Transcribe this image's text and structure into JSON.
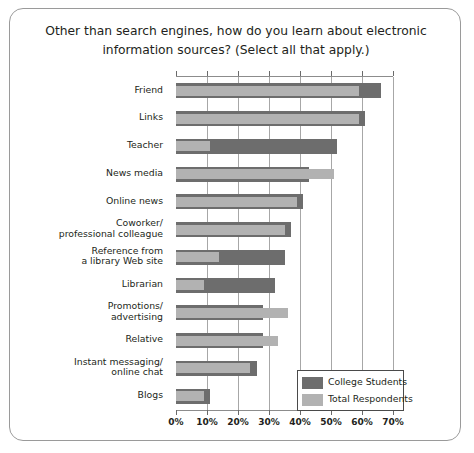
{
  "chart_data": {
    "type": "bar",
    "orientation": "horizontal",
    "title": "Other than search engines, how do you learn about electronic information sources? (Select all that apply.)",
    "title_line1": "Other than search engines, how do you learn about electronic",
    "title_line2": "information sources? (Select all that apply.)",
    "xlabel": "",
    "ylabel": "",
    "xlim": [
      0,
      70
    ],
    "xticks": [
      0,
      10,
      20,
      30,
      40,
      50,
      60,
      70
    ],
    "xtick_labels": [
      "0%",
      "10%",
      "20%",
      "30%",
      "40%",
      "50%",
      "60%",
      "70%"
    ],
    "grid": true,
    "legend_position": "bottom-right",
    "categories": [
      "Friend",
      "Links",
      "Teacher",
      "News media",
      "Online news",
      "Coworker/\nprofessional colleague",
      "Reference from\na library Web site",
      "Librarian",
      "Promotions/\nadvertising",
      "Relative",
      "Instant messaging/\nonline chat",
      "Blogs"
    ],
    "series": [
      {
        "name": "College Students",
        "color": "#6d6d6d",
        "values": [
          66,
          61,
          52,
          43,
          41,
          37,
          35,
          32,
          28,
          28,
          26,
          11
        ]
      },
      {
        "name": "Total Respondents",
        "color": "#b2b2b2",
        "values": [
          59,
          59,
          11,
          51,
          39,
          35,
          14,
          9,
          36,
          33,
          24,
          9
        ]
      }
    ]
  },
  "legend": {
    "items": [
      {
        "label": "College Students",
        "color": "#6d6d6d"
      },
      {
        "label": "Total Respondents",
        "color": "#b2b2b2"
      }
    ]
  }
}
